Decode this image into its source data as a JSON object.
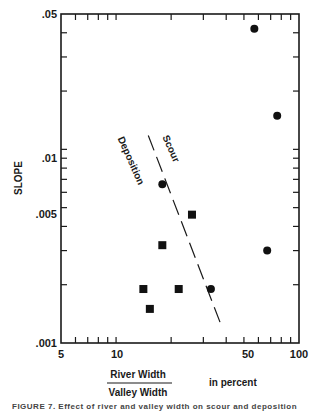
{
  "chart_data": {
    "type": "scatter",
    "title": "",
    "xlabel": "River Width / Valley Width in percent",
    "xlabel_numerator": "River Width",
    "xlabel_denominator": "Valley Width",
    "xlabel_unit": "in percent",
    "ylabel": "SLOPE",
    "xscale": "log",
    "yscale": "log",
    "xlim": [
      5,
      100
    ],
    "ylim": [
      0.001,
      0.05
    ],
    "x_tick_labels": [
      "5",
      "10",
      "50",
      "100"
    ],
    "x_tick_values": [
      5,
      10,
      50,
      100
    ],
    "y_tick_labels": [
      ".001",
      ".005",
      ".01",
      ".05"
    ],
    "y_tick_values": [
      0.001,
      0.005,
      0.01,
      0.05
    ],
    "grid": false,
    "series": [
      {
        "name": "circles",
        "marker": "circle",
        "points": [
          {
            "x": 57,
            "y": 0.042
          },
          {
            "x": 76,
            "y": 0.0149
          },
          {
            "x": 17.9,
            "y": 0.0066
          },
          {
            "x": 67,
            "y": 0.003
          },
          {
            "x": 33,
            "y": 0.0019
          }
        ]
      },
      {
        "name": "squares",
        "marker": "square",
        "points": [
          {
            "x": 26,
            "y": 0.0046
          },
          {
            "x": 17.9,
            "y": 0.0032
          },
          {
            "x": 14.1,
            "y": 0.0019
          },
          {
            "x": 22,
            "y": 0.0019
          },
          {
            "x": 15.3,
            "y": 0.0015
          }
        ]
      }
    ],
    "boundary_line": {
      "style": "dashed",
      "from": {
        "x": 15,
        "y": 0.0118
      },
      "to": {
        "x": 38,
        "y": 0.0012
      }
    },
    "annotations": [
      {
        "text": "Scour",
        "side": "upper-right of line"
      },
      {
        "text": "Deposition",
        "side": "lower-left of line"
      }
    ]
  },
  "labels": {
    "y_axis_title": "SLOPE",
    "x_num": "River Width",
    "x_den": "Valley Width",
    "x_unit": "in percent",
    "scour": "Scour",
    "deposition": "Deposition",
    "x_ticks": [
      "5",
      "10",
      "50",
      "100"
    ],
    "y_ticks": [
      ".05",
      ".01",
      ".005",
      ".001"
    ],
    "caption": "FIGURE 7. Effect of river and valley width on scour and deposition"
  }
}
